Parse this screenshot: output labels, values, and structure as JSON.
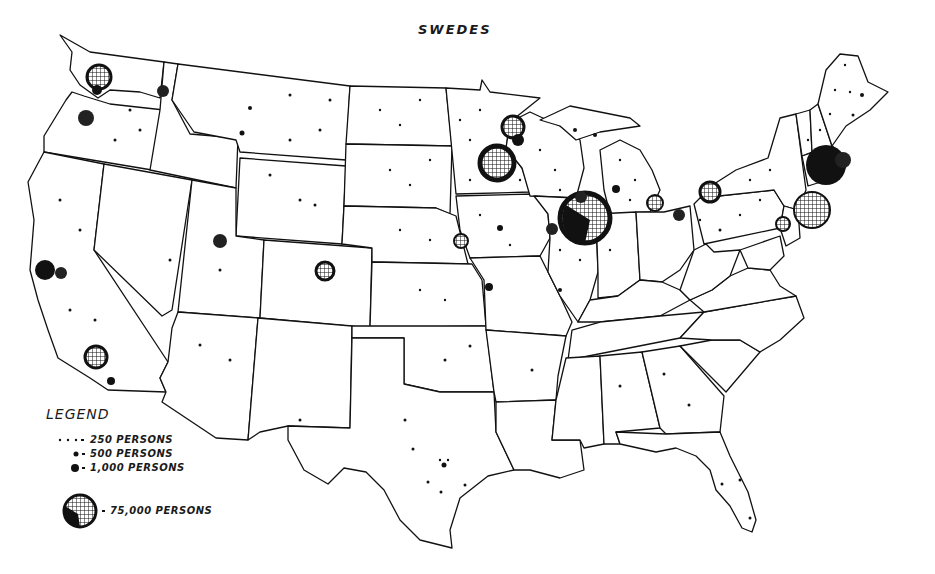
{
  "title": "SWEDES",
  "legend": {
    "title": "LEGEND",
    "items": [
      {
        "symbol": "small-dot",
        "label": "250 PERSONS"
      },
      {
        "symbol": "medium-dot",
        "label": "500 PERSONS"
      },
      {
        "symbol": "large-dot",
        "label": "1,000 PERSONS"
      },
      {
        "symbol": "globe",
        "label": "75,000 PERSONS"
      }
    ]
  },
  "colors": {
    "ink": "#111111",
    "paper": "#ffffff"
  },
  "clusters": [
    {
      "area": "Seattle",
      "x": 99,
      "y": 77,
      "r": 12
    },
    {
      "area": "Spokane",
      "x": 163,
      "y": 91,
      "r": 6
    },
    {
      "area": "Portland",
      "x": 86,
      "y": 118,
      "r": 8
    },
    {
      "area": "San Francisco",
      "x": 45,
      "y": 270,
      "r": 10
    },
    {
      "area": "Oakland",
      "x": 61,
      "y": 273,
      "r": 6
    },
    {
      "area": "Los Angeles",
      "x": 96,
      "y": 357,
      "r": 11
    },
    {
      "area": "San Diego",
      "x": 111,
      "y": 381,
      "r": 4
    },
    {
      "area": "Salt Lake City",
      "x": 220,
      "y": 241,
      "r": 7
    },
    {
      "area": "Denver",
      "x": 325,
      "y": 271,
      "r": 9
    },
    {
      "area": "Duluth",
      "x": 513,
      "y": 127,
      "r": 11
    },
    {
      "area": "Minneapolis-St. Paul",
      "x": 497,
      "y": 163,
      "r": 17
    },
    {
      "area": "Chicago",
      "x": 585,
      "y": 218,
      "r": 25
    },
    {
      "area": "Rockford",
      "x": 581,
      "y": 197,
      "r": 6
    },
    {
      "area": "Omaha",
      "x": 461,
      "y": 241,
      "r": 7
    },
    {
      "area": "Moline",
      "x": 552,
      "y": 229,
      "r": 6
    },
    {
      "area": "Kansas City",
      "x": 489,
      "y": 287,
      "r": 4
    },
    {
      "area": "Grand Rapids",
      "x": 616,
      "y": 189,
      "r": 4
    },
    {
      "area": "Detroit",
      "x": 655,
      "y": 203,
      "r": 8
    },
    {
      "area": "Jamestown",
      "x": 710,
      "y": 192,
      "r": 10
    },
    {
      "area": "Cleveland",
      "x": 679,
      "y": 215,
      "r": 6
    },
    {
      "area": "Worcester-Boston",
      "x": 826,
      "y": 165,
      "r": 20
    },
    {
      "area": "New York",
      "x": 812,
      "y": 210,
      "r": 18
    },
    {
      "area": "Philadelphia",
      "x": 783,
      "y": 224,
      "r": 7
    }
  ]
}
